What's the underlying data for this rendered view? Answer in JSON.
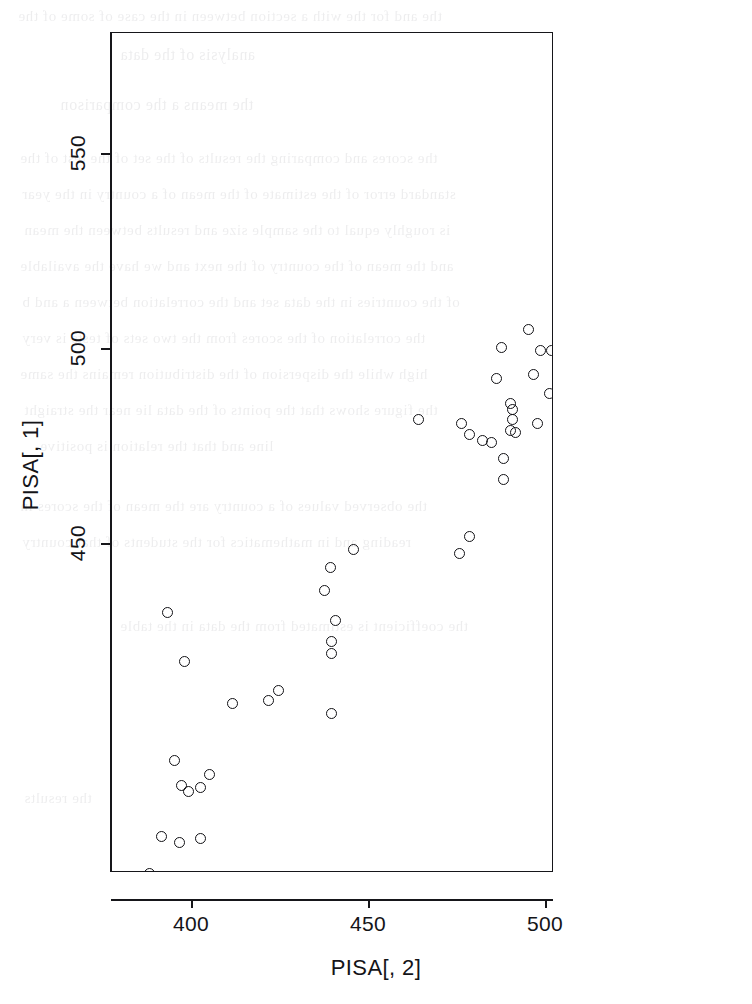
{
  "figure": {
    "kind": "r-base-scatterplot",
    "background_color": "#ffffff",
    "ink_color": "#16161a"
  },
  "axis_titles": {
    "x": "PISA[, 2]",
    "y": "PISA[, 1]"
  },
  "ticks": {
    "x_labels": [
      "400",
      "450",
      "500"
    ],
    "y_labels": [
      "450",
      "500",
      "550"
    ]
  },
  "bleed_through_text": [
    "the and for the with a section between in the case of some of the",
    "analysis of the data",
    "the means a the comparison",
    "the scores and comparing the results of the set of the test of the",
    "standard error of the estimate of the mean of a country in the year",
    "is roughly equal to the sample size and results between the mean",
    "and the mean of the country of the next and we have the available",
    "of the countries in the data set and the correlation between a and b",
    "the correlation of the scores from the two sets of tests is very",
    "high while the dispersion of the distribution remains the same",
    "the figure shows that the points of the data lie near the straight",
    "line and that the relation is positive",
    "the observed values of a country are the mean of the scores in",
    "reading and in mathematics for the students of that country",
    "the coefficient is estimated from the data in the table",
    "the results"
  ],
  "chart_data": {
    "type": "scatter",
    "title": "",
    "xlabel": "PISA[, 2]",
    "ylabel": "PISA[, 1]",
    "xlim": [
      382.5,
      542.5
    ],
    "ylim": [
      362.0,
      578.0
    ],
    "grid": false,
    "legend": null,
    "marker": {
      "shape": "open-circle",
      "size_px": 11,
      "color": "#111115",
      "fill": "none"
    },
    "xticks": [
      400,
      450,
      500
    ],
    "yticks": [
      450,
      500,
      550
    ],
    "n_points": 60,
    "points": [
      {
        "x": 538.0,
        "y": 574.0
      },
      {
        "x": 531.0,
        "y": 553.5
      },
      {
        "x": 537.5,
        "y": 535.5
      },
      {
        "x": 516.5,
        "y": 535.0
      },
      {
        "x": 510.5,
        "y": 529.5
      },
      {
        "x": 513.5,
        "y": 521.0
      },
      {
        "x": 516.0,
        "y": 517.5
      },
      {
        "x": 521.5,
        "y": 518.5
      },
      {
        "x": 524.0,
        "y": 518.5
      },
      {
        "x": 509.0,
        "y": 514.5
      },
      {
        "x": 509.5,
        "y": 513.0
      },
      {
        "x": 508.5,
        "y": 509.0
      },
      {
        "x": 495.0,
        "y": 505.0
      },
      {
        "x": 513.5,
        "y": 500.5
      },
      {
        "x": 523.5,
        "y": 500.5
      },
      {
        "x": 513.5,
        "y": 497.0
      },
      {
        "x": 487.5,
        "y": 500.5
      },
      {
        "x": 498.5,
        "y": 499.5
      },
      {
        "x": 501.5,
        "y": 499.5
      },
      {
        "x": 504.0,
        "y": 493.0
      },
      {
        "x": 496.5,
        "y": 493.5
      },
      {
        "x": 486.0,
        "y": 492.5
      },
      {
        "x": 501.0,
        "y": 488.5
      },
      {
        "x": 490.0,
        "y": 486.0
      },
      {
        "x": 490.5,
        "y": 484.5
      },
      {
        "x": 490.5,
        "y": 482.0
      },
      {
        "x": 490.0,
        "y": 479.0
      },
      {
        "x": 491.5,
        "y": 478.5
      },
      {
        "x": 464.0,
        "y": 482.0
      },
      {
        "x": 476.0,
        "y": 481.0
      },
      {
        "x": 497.5,
        "y": 481.0
      },
      {
        "x": 478.5,
        "y": 478.0
      },
      {
        "x": 482.0,
        "y": 476.5
      },
      {
        "x": 484.5,
        "y": 476.0
      },
      {
        "x": 488.0,
        "y": 472.0
      },
      {
        "x": 488.0,
        "y": 466.5
      },
      {
        "x": 478.5,
        "y": 452.0
      },
      {
        "x": 475.5,
        "y": 447.5
      },
      {
        "x": 445.5,
        "y": 448.5
      },
      {
        "x": 439.0,
        "y": 444.0
      },
      {
        "x": 437.5,
        "y": 438.0
      },
      {
        "x": 393.0,
        "y": 432.5
      },
      {
        "x": 440.5,
        "y": 430.5
      },
      {
        "x": 439.5,
        "y": 425.0
      },
      {
        "x": 439.5,
        "y": 422.0
      },
      {
        "x": 398.0,
        "y": 420.0
      },
      {
        "x": 424.5,
        "y": 412.5
      },
      {
        "x": 421.5,
        "y": 410.0
      },
      {
        "x": 411.5,
        "y": 409.0
      },
      {
        "x": 439.5,
        "y": 406.5
      },
      {
        "x": 395.0,
        "y": 394.5
      },
      {
        "x": 405.0,
        "y": 391.0
      },
      {
        "x": 397.0,
        "y": 388.0
      },
      {
        "x": 402.5,
        "y": 387.5
      },
      {
        "x": 399.0,
        "y": 386.5
      },
      {
        "x": 391.5,
        "y": 375.0
      },
      {
        "x": 396.5,
        "y": 373.5
      },
      {
        "x": 402.5,
        "y": 374.5
      },
      {
        "x": 388.0,
        "y": 365.5
      }
    ]
  }
}
